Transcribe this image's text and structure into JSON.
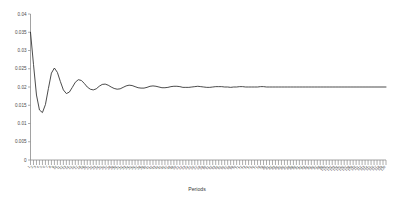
{
  "chart_data": {
    "type": "line",
    "title": "",
    "xlabel": "Periods",
    "ylabel": "",
    "xlim": [
      1,
      120
    ],
    "ylim": [
      0,
      0.04
    ],
    "grid": false,
    "legend": false,
    "y_ticks": [
      0,
      0.005,
      0.01,
      0.015,
      0.02,
      0.025,
      0.03,
      0.035,
      0.04
    ],
    "y_tick_labels": [
      "0",
      "0.005",
      "0.01",
      "0.015",
      "0.02",
      "0.025",
      "0.03",
      "0.035",
      "0.04"
    ],
    "x_ticks": [
      1,
      2,
      3,
      4,
      5,
      6,
      7,
      8,
      9,
      10,
      11,
      12,
      13,
      14,
      15,
      16,
      17,
      18,
      19,
      20,
      21,
      22,
      23,
      24,
      25,
      26,
      27,
      28,
      29,
      30,
      31,
      32,
      33,
      34,
      35,
      36,
      37,
      38,
      39,
      40,
      41,
      42,
      43,
      44,
      45,
      46,
      47,
      48,
      49,
      50,
      51,
      52,
      53,
      54,
      55,
      56,
      57,
      58,
      59,
      60,
      61,
      62,
      63,
      64,
      65,
      66,
      67,
      68,
      69,
      70,
      71,
      72,
      73,
      74,
      75,
      76,
      77,
      78,
      79,
      80,
      81,
      82,
      83,
      84,
      85,
      86,
      87,
      88,
      89,
      90,
      91,
      92,
      93,
      94,
      95,
      96,
      97,
      98,
      99,
      100,
      101,
      102,
      103,
      104,
      105,
      106,
      107,
      108,
      109,
      110,
      111,
      112,
      113,
      114,
      115,
      116,
      117,
      118,
      119,
      120
    ],
    "x_tick_labels": [
      "1",
      "2",
      "3",
      "4",
      "5",
      "6",
      "7",
      "8",
      "9",
      "10",
      "11",
      "12",
      "13",
      "14",
      "15",
      "16",
      "17",
      "18",
      "19",
      "20",
      "21",
      "22",
      "23",
      "24",
      "25",
      "26",
      "27",
      "28",
      "29",
      "30",
      "31",
      "32",
      "33",
      "34",
      "35",
      "36",
      "37",
      "38",
      "39",
      "40",
      "41",
      "42",
      "43",
      "44",
      "45",
      "46",
      "47",
      "48",
      "49",
      "50",
      "51",
      "52",
      "53",
      "54",
      "55",
      "56",
      "57",
      "58",
      "59",
      "60",
      "61",
      "62",
      "63",
      "64",
      "65",
      "66",
      "67",
      "68",
      "69",
      "70",
      "71",
      "72",
      "73",
      "74",
      "75",
      "76",
      "77",
      "78",
      "79",
      "80",
      "81",
      "82",
      "83",
      "84",
      "85",
      "86",
      "87",
      "88",
      "89",
      "90",
      "91",
      "92",
      "93",
      "94",
      "95",
      "96",
      "97",
      "98",
      "99",
      "100",
      "101",
      "102",
      "103",
      "104",
      "105",
      "106",
      "107",
      "108",
      "109",
      "110",
      "111",
      "112",
      "113",
      "114",
      "115",
      "116",
      "117",
      "118",
      "119",
      "120"
    ],
    "x_tick_label_rotation": 45,
    "series": [
      {
        "name": "response",
        "color": "#2b2b2b",
        "x": [
          1,
          2,
          3,
          4,
          5,
          6,
          7,
          8,
          9,
          10,
          11,
          12,
          13,
          14,
          15,
          16,
          17,
          18,
          19,
          20,
          21,
          22,
          23,
          24,
          25,
          26,
          27,
          28,
          29,
          30,
          31,
          32,
          33,
          34,
          35,
          36,
          37,
          38,
          39,
          40,
          41,
          42,
          43,
          44,
          45,
          46,
          47,
          48,
          49,
          50,
          51,
          52,
          53,
          54,
          55,
          56,
          57,
          58,
          59,
          60,
          61,
          62,
          63,
          64,
          65,
          66,
          67,
          68,
          69,
          70,
          71,
          72,
          73,
          74,
          75,
          76,
          77,
          78,
          79,
          80,
          81,
          82,
          83,
          84,
          85,
          86,
          87,
          88,
          89,
          90,
          91,
          92,
          93,
          94,
          95,
          96,
          97,
          98,
          99,
          100,
          101,
          102,
          103,
          104,
          105,
          106,
          107,
          108,
          109,
          110,
          111,
          112,
          113,
          114,
          115,
          116,
          117,
          118,
          119,
          120
        ],
        "y": [
          0.035,
          0.0262,
          0.0178,
          0.0137,
          0.013,
          0.0152,
          0.0196,
          0.0238,
          0.0252,
          0.024,
          0.0215,
          0.0192,
          0.0182,
          0.0186,
          0.0199,
          0.0213,
          0.022,
          0.0218,
          0.021,
          0.02,
          0.0194,
          0.0192,
          0.0195,
          0.0202,
          0.0207,
          0.0208,
          0.0205,
          0.02,
          0.0196,
          0.0194,
          0.0195,
          0.0199,
          0.0203,
          0.0205,
          0.0204,
          0.0201,
          0.0198,
          0.0197,
          0.0197,
          0.0199,
          0.0202,
          0.0203,
          0.0202,
          0.02,
          0.0198,
          0.0198,
          0.0199,
          0.0201,
          0.0202,
          0.0202,
          0.0201,
          0.0199,
          0.0199,
          0.0199,
          0.02,
          0.0201,
          0.0202,
          0.0201,
          0.02,
          0.0199,
          0.0199,
          0.02,
          0.0201,
          0.0201,
          0.0201,
          0.02,
          0.02,
          0.0199,
          0.02,
          0.02,
          0.0201,
          0.0201,
          0.02,
          0.02,
          0.02,
          0.02,
          0.02,
          0.0201,
          0.0201,
          0.02,
          0.02,
          0.02,
          0.02,
          0.02,
          0.02,
          0.02,
          0.02,
          0.02,
          0.02,
          0.02,
          0.02,
          0.02,
          0.02,
          0.02,
          0.02,
          0.02,
          0.02,
          0.02,
          0.02,
          0.02,
          0.02,
          0.02,
          0.02,
          0.02,
          0.02,
          0.02,
          0.02,
          0.02,
          0.02,
          0.02,
          0.02,
          0.02,
          0.02,
          0.02,
          0.02,
          0.02,
          0.02,
          0.02,
          0.02,
          0.02
        ]
      }
    ]
  }
}
